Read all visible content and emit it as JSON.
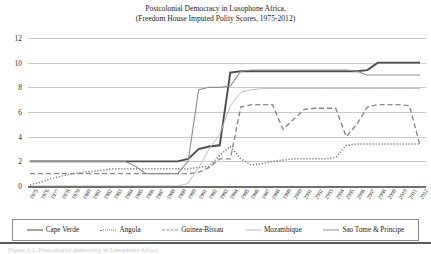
{
  "title": {
    "line1": "Postcolonial Democracy in Lusophone Africa,",
    "line2": "(Freedom House Imputed Polity Scores, 1975-2012)"
  },
  "caption": "Figure 1.1. Postcolonial democracy in Lusophone Africa.",
  "axes": {
    "y_ticks": [
      "0",
      "2",
      "4",
      "6",
      "8",
      "10",
      "12"
    ],
    "ylim": [
      0,
      12
    ],
    "ylabel": "",
    "xlabel": "",
    "grid": true
  },
  "legend": {
    "position": "bottom",
    "items": [
      {
        "label": "Cape Verde",
        "style": "solid-thick",
        "color": "#4d4d4d",
        "swatch": "line-swatch"
      },
      {
        "label": "Angola",
        "style": "dotted",
        "color": "#7a7a7a",
        "swatch": "line-swatch"
      },
      {
        "label": "Guinea-Bissau",
        "style": "dashed",
        "color": "#8a8a8a",
        "swatch": "line-swatch"
      },
      {
        "label": "Mozambique",
        "style": "thin",
        "color": "#b9b9b9",
        "swatch": "line-swatch"
      },
      {
        "label": "Sao Tome & Principe",
        "style": "solid",
        "color": "#8f8f8f",
        "swatch": "line-swatch"
      }
    ]
  },
  "chart_data": {
    "type": "line",
    "title": "Postcolonial Democracy in Lusophone Africa, (Freedom House Imputed Polity Scores, 1975-2012)",
    "xlabel": "",
    "ylabel": "",
    "ylim": [
      0,
      12
    ],
    "ytick_values": [
      0,
      2,
      4,
      6,
      8,
      10,
      12
    ],
    "grid": true,
    "legend_position": "bottom",
    "x": [
      1975,
      1976,
      1977,
      1978,
      1979,
      1980,
      1981,
      1982,
      1983,
      1984,
      1985,
      1986,
      1987,
      1988,
      1989,
      1990,
      1991,
      1992,
      1993,
      1994,
      1995,
      1996,
      1997,
      1998,
      1999,
      2000,
      2001,
      2002,
      2003,
      2004,
      2005,
      2006,
      2007,
      2008,
      2009,
      2010,
      2011,
      2012
    ],
    "series": [
      {
        "name": "Cape Verde",
        "style": "solid-thick",
        "color": "#4d4d4d",
        "values": [
          2,
          2,
          2,
          2,
          2,
          2,
          2,
          2,
          2,
          2,
          2,
          2,
          2,
          2,
          2,
          2.2,
          3,
          3.2,
          3.3,
          9.2,
          9.3,
          9.3,
          9.3,
          9.3,
          9.3,
          9.3,
          9.3,
          9.3,
          9.3,
          9.3,
          9.3,
          9.3,
          9.4,
          10,
          10,
          10,
          10,
          10
        ]
      },
      {
        "name": "Angola",
        "style": "dotted",
        "color": "#7a7a7a",
        "values": [
          0.1,
          0.3,
          0.6,
          0.8,
          1,
          1.1,
          1.2,
          1.3,
          1.4,
          1.4,
          1.4,
          1.4,
          1.4,
          1.4,
          1.4,
          1.4,
          1.5,
          1.6,
          2.5,
          3.2,
          2.2,
          1.7,
          1.8,
          2,
          2.1,
          2.2,
          2.2,
          2.2,
          2.2,
          2.3,
          3.3,
          3.4,
          3.4,
          3.4,
          3.4,
          3.4,
          3.4,
          3.4
        ]
      },
      {
        "name": "Guinea-Bissau",
        "style": "dashed",
        "color": "#8a8a8a",
        "values": [
          1,
          1,
          1,
          1,
          1,
          1,
          1,
          1,
          1,
          1,
          1,
          1,
          1,
          1,
          1,
          1,
          1.1,
          1.5,
          2.2,
          2.2,
          6.4,
          6.6,
          6.6,
          6.6,
          4.6,
          5.4,
          6.2,
          6.3,
          6.3,
          6.3,
          4,
          5,
          6.4,
          6.6,
          6.6,
          6.6,
          6.5,
          3.3
        ]
      },
      {
        "name": "Mozambique",
        "style": "thin",
        "color": "#b9b9b9",
        "values": [
          0,
          0,
          0,
          0,
          0,
          0,
          0,
          0,
          0,
          0,
          0,
          0,
          0,
          0,
          0,
          0.2,
          1.5,
          3,
          4.2,
          6.5,
          7.6,
          7.8,
          7.9,
          7.9,
          7.9,
          7.9,
          7.9,
          7.9,
          7.9,
          7.9,
          7.9,
          7.9,
          7.9,
          7.9,
          7.9,
          7.9,
          7.9,
          7.9
        ]
      },
      {
        "name": "Sao Tome & Principe",
        "style": "solid",
        "color": "#8f8f8f",
        "values": [
          2,
          2,
          2,
          2,
          2,
          2,
          2,
          2,
          2,
          2,
          1.6,
          1,
          1,
          1,
          1,
          2,
          7.8,
          8,
          8,
          8.1,
          9.3,
          9.4,
          9.4,
          9.4,
          9.4,
          9.4,
          9.4,
          9.4,
          9.4,
          9.4,
          9.4,
          9.3,
          9,
          9,
          9,
          9,
          9,
          9
        ]
      }
    ]
  },
  "xticks": [
    "1975",
    "1976",
    "1977",
    "1978",
    "1979",
    "1980",
    "1981",
    "1982",
    "1983",
    "1984",
    "1985",
    "1986",
    "1987",
    "1988",
    "1989",
    "1990",
    "1991",
    "1992",
    "1993",
    "1994",
    "1995",
    "1996",
    "1997",
    "1998",
    "1999",
    "2000",
    "2001",
    "2002",
    "2003",
    "2004",
    "2005",
    "2006",
    "2007",
    "2008",
    "2009",
    "2010",
    "2011",
    "2012"
  ]
}
